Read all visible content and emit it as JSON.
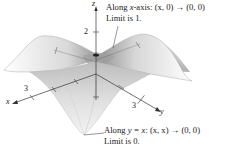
{
  "figure": {
    "axes": {
      "x_label": "x",
      "y_label": "y",
      "z_label": "z",
      "x_tick": "3",
      "y_tick": "3",
      "z_tick": "2"
    },
    "annotations": {
      "top": {
        "line1_prefix": "Along ",
        "line1_var": "x",
        "line1_suffix": "-axis:  (x, 0) → (0, 0)",
        "line2": "Limit is 1."
      },
      "bottom": {
        "line1_prefix": "Along ",
        "line1_var": "y = x",
        "line1_suffix": ":  (x, x) → (0, 0)",
        "line2": "Limit is 0."
      }
    },
    "colors": {
      "surface_light": "#f2f2f2",
      "surface_mid": "#c8c8c8",
      "surface_dark": "#8a8a8a",
      "axis": "#333333",
      "text": "#1a1a1a"
    }
  }
}
